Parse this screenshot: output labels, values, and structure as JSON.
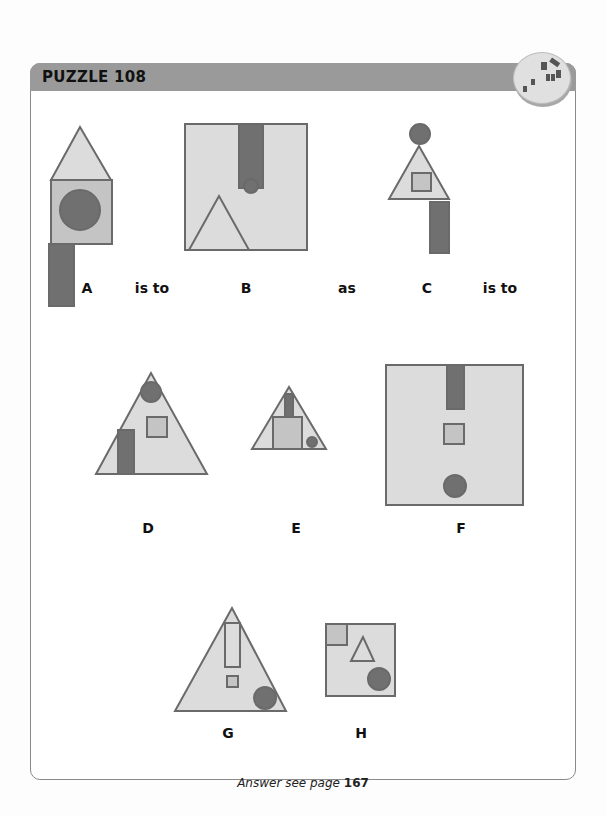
{
  "header": {
    "title": "PUZZLE 108",
    "badge_icon": "puzzle-blocks-icon"
  },
  "colors": {
    "light_fill": "#dcdcdc",
    "mid_fill": "#c4c4c4",
    "dark_fill": "#707070",
    "stroke": "#6a6a6a",
    "header_bar": "#9a9a9a"
  },
  "analogy": {
    "figures": [
      {
        "id": "A",
        "label": "A"
      },
      {
        "id": "B",
        "label": "B"
      },
      {
        "id": "C",
        "label": "C"
      }
    ],
    "connectors": [
      "is to",
      "as",
      "is to"
    ]
  },
  "options": {
    "figures": [
      {
        "id": "D",
        "label": "D"
      },
      {
        "id": "E",
        "label": "E"
      },
      {
        "id": "F",
        "label": "F"
      },
      {
        "id": "G",
        "label": "G"
      },
      {
        "id": "H",
        "label": "H"
      }
    ]
  },
  "footer": {
    "prefix": "Answer see page",
    "page": "167"
  }
}
